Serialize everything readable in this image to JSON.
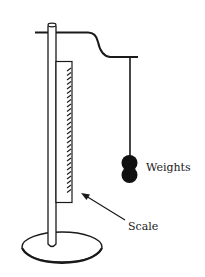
{
  "diagram": {
    "colors": {
      "stroke": "#1a1a1a",
      "fill_weights": "#111111",
      "background": "#ffffff"
    },
    "labels": {
      "weights": "Weights",
      "scale": "Scale"
    },
    "components": [
      {
        "name": "stand-pole",
        "description": "vertical rod"
      },
      {
        "name": "support-arm",
        "description": "horizontal arm with S-bend"
      },
      {
        "name": "string",
        "description": "vertical string from arm"
      },
      {
        "name": "weights",
        "description": "two stacked spherical weights",
        "count": 2
      },
      {
        "name": "scale",
        "description": "graduated vertical scale with tick marks"
      },
      {
        "name": "base",
        "description": "elliptical base plate"
      },
      {
        "name": "arrow",
        "description": "pointer from 'Scale' label to scale"
      }
    ]
  }
}
